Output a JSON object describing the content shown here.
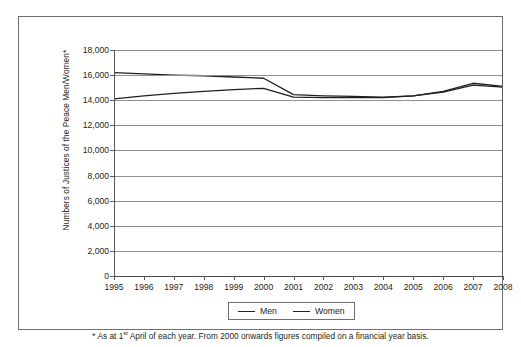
{
  "chart_data": {
    "type": "line",
    "title": "",
    "xlabel": "",
    "ylabel": "Numbers of Justices of the Peace Men/Women*",
    "categories": [
      "1995",
      "1996",
      "1997",
      "1998",
      "1999",
      "2000",
      "2001",
      "2002",
      "2003",
      "2004",
      "2005",
      "2006",
      "2007",
      "2008"
    ],
    "ylim": [
      0,
      18000
    ],
    "yticks": [
      0,
      2000,
      4000,
      6000,
      8000,
      10000,
      12000,
      14000,
      16000,
      18000
    ],
    "ytick_labels": [
      "0",
      "2,000",
      "4,000",
      "6,000",
      "8,000",
      "10,000",
      "12,000",
      "14,000",
      "16,000",
      "18,000"
    ],
    "grid": true,
    "legend_position": "bottom",
    "series": [
      {
        "name": "Men",
        "color": "#231f20",
        "values": [
          16200,
          16100,
          16000,
          15950,
          15850,
          15750,
          14450,
          14350,
          14300,
          14250,
          14350,
          14650,
          15200,
          15050
        ]
      },
      {
        "name": "Women",
        "color": "#231f20",
        "values": [
          14100,
          14350,
          14550,
          14700,
          14850,
          14950,
          14250,
          14200,
          14200,
          14200,
          14350,
          14700,
          15350,
          15100
        ]
      }
    ],
    "annotations": [
      "* As at 1st April of each year. From 2000 onwards figures compiled on a financial year basis."
    ]
  },
  "axis": {
    "y_title": "Numbers of Justices of the Peace Men/Women*"
  },
  "legend": {
    "entries": [
      {
        "label": "Men",
        "swatch": "line-swatch-icon"
      },
      {
        "label": "Women",
        "swatch": "line-swatch-icon"
      }
    ]
  },
  "footnote": {
    "prefix": "* As at 1",
    "ordinal": "st",
    "suffix": " April of each year. From 2000 onwards figures compiled on a financial year basis."
  }
}
